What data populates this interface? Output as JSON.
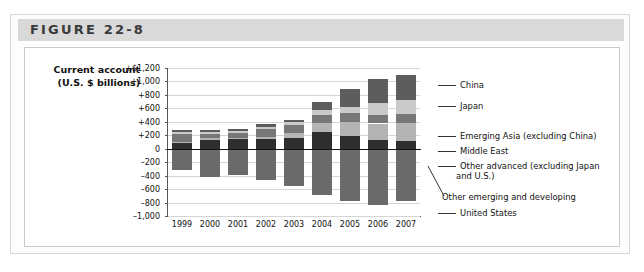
{
  "figure": {
    "label": "FIGURE 22-8"
  },
  "axis_title": {
    "line1": "Current account",
    "line2": "(U.S. $ billions)"
  },
  "chart_data": {
    "type": "bar",
    "subtype": "stacked-diverging",
    "title": "FIGURE 22-8",
    "xlabel": "",
    "ylabel": "Current account (U.S. $ billions)",
    "ylim": [
      -1000,
      1200
    ],
    "ytick_values": [
      1200,
      1000,
      800,
      600,
      400,
      200,
      0,
      -200,
      -400,
      -600,
      -800,
      -1000
    ],
    "ytick_labels": [
      "+$1,200",
      "+1,000",
      "+800",
      "+600",
      "+400",
      "+200",
      "0",
      "–200",
      "–400",
      "–600",
      "–800",
      "–1,000"
    ],
    "grid": true,
    "legend_position": "right",
    "categories": [
      "1999",
      "2000",
      "2001",
      "2002",
      "2003",
      "2004",
      "2005",
      "2006",
      "2007"
    ],
    "series": [
      {
        "name": "Other advanced (excluding Japan and U.S.)",
        "color": "#2e2e2e",
        "values": [
          80,
          130,
          140,
          140,
          165,
          255,
          195,
          130,
          120
        ]
      },
      {
        "name": "Middle East",
        "color": "#b4b4b4",
        "values": [
          25,
          30,
          20,
          40,
          75,
          130,
          195,
          245,
          265
        ]
      },
      {
        "name": "Emerging Asia (excluding China)",
        "color": "#777777",
        "values": [
          110,
          60,
          80,
          110,
          110,
          110,
          135,
          125,
          130
        ]
      },
      {
        "name": "Japan",
        "color": "#c9c9c9",
        "values": [
          35,
          25,
          30,
          40,
          45,
          75,
          90,
          175,
          215
        ]
      },
      {
        "name": "China",
        "color": "#5d5d5d",
        "values": [
          25,
          30,
          20,
          35,
          35,
          125,
          275,
          355,
          370
        ]
      },
      {
        "name": "United States",
        "color": "#6a6a6a",
        "values": [
          -320,
          -420,
          -390,
          -460,
          -550,
          -690,
          -780,
          -830,
          -770
        ]
      }
    ],
    "legend_entries": [
      {
        "label": "China",
        "color": "#5d5d5d"
      },
      {
        "label": "Japan",
        "color": "#c9c9c9"
      },
      {
        "label": "Emerging Asia (excluding China)",
        "color": "#777777"
      },
      {
        "label": "Middle East",
        "color": "#b4b4b4"
      },
      {
        "label": "Other advanced (excluding Japan",
        "color": "#2e2e2e"
      },
      {
        "label": "and U.S.)",
        "color": ""
      },
      {
        "label": "Other emerging and developing",
        "color": "#9a9a9a"
      },
      {
        "label": "United States",
        "color": "#6a6a6a"
      }
    ]
  }
}
